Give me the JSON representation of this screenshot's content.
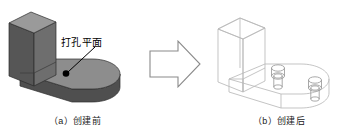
{
  "figure": {
    "type": "cad-illustration",
    "background_color": "#ffffff"
  },
  "before": {
    "caption": "（a）创建前",
    "callout_label": "打孔平面",
    "callout_target": "top face of base slab",
    "shading": {
      "top_face": "#9a9a9a",
      "front_face": "#585858",
      "side_face": "#6e6e6e",
      "slab_top": "#8d8d8d",
      "slab_front": "#4f4f4f",
      "edge": "#2b2b2b"
    },
    "marker_color": "#000000",
    "leader_color": "#000000"
  },
  "arrow": {
    "name": "process-arrow",
    "direction": "right",
    "stroke": "#8a8a8a",
    "fill": "#ffffff"
  },
  "after": {
    "caption": "（b）创建后",
    "wireframe_stroke": "#b9b9b9",
    "hole_stroke": "#9a9a9a",
    "hole_count": 2,
    "hole_type": "counterbore"
  }
}
